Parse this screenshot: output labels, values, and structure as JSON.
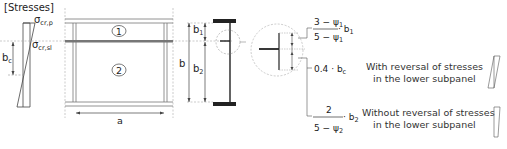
{
  "title": "[Stresses]",
  "stress_diagram": {
    "sigma_top": "σ",
    "sigma_top_sub": "cr,p",
    "sigma_mid": "σ",
    "sigma_mid_sub": "cr,sl",
    "bc_label": "b",
    "bc_sub": "c"
  },
  "panel": {
    "subpanel_1": "1",
    "subpanel_2": "2",
    "width_label": "a"
  },
  "section": {
    "b_label": "b",
    "b1_label": "b",
    "b1_sub": "1",
    "b2_label": "b",
    "b2_sub": "2"
  },
  "formulas": {
    "f1_num": "3 − ψ",
    "f1_num_sub": "1",
    "f1_den": "5 − ψ",
    "f1_den_sub": "1",
    "f1_mult": "· b",
    "f1_mult_sub": "1",
    "f2": "0.4 · b",
    "f2_sub": "c",
    "f3_num": "2",
    "f3_den": "5 − ψ",
    "f3_den_sub": "2",
    "f3_mult": "· b",
    "f3_mult_sub": "2"
  },
  "legend": {
    "case1_line1": "With reversal of stresses",
    "case1_line2": "in the lower subpanel",
    "case2_line1": "Without reversal of stresses",
    "case2_line2": "in the lower subpanel"
  }
}
